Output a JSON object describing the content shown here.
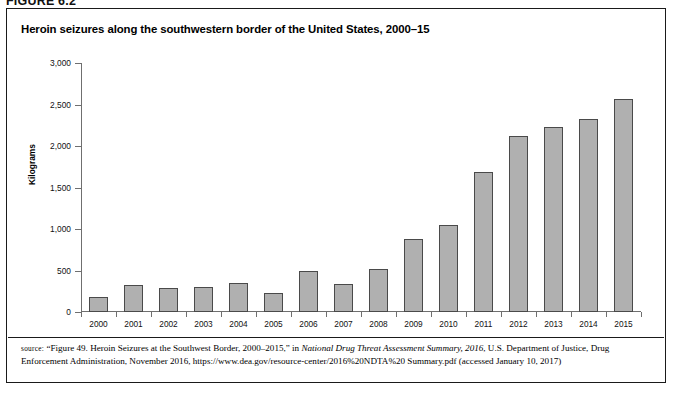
{
  "figure": {
    "label": "FIGURE 6.2",
    "title": "Heroin seizures along the southwestern border of the United States, 2000–15"
  },
  "axes": {
    "ylabel": "Kilograms",
    "yticks": [
      "0",
      "500",
      "1,000",
      "1,500",
      "2,000",
      "2,500",
      "3,000"
    ],
    "ymin": 0,
    "ymax": 3000,
    "ystep": 500
  },
  "source": {
    "prefix": "source:",
    "part1": " “Figure 49. Heroin Seizures at the Southwest Border, 2000–2015,” in ",
    "italic1": "National Drug Threat Assessment Summary, 2016",
    "part2": ", U.S. Department of Justice, Drug Enforcement Administration, November 2016, https://www.dea.gov/resource-center/2016%20NDTA%20 Summary.pdf (accessed January 10, 2017)"
  },
  "chart_data": {
    "type": "bar",
    "title": "Heroin seizures along the southwestern border of the United States, 2000–15",
    "xlabel": "",
    "ylabel": "Kilograms",
    "ylim": [
      0,
      3000
    ],
    "ytick_step": 500,
    "grid": false,
    "legend": "none",
    "categories": [
      "2000",
      "2001",
      "2002",
      "2003",
      "2004",
      "2005",
      "2006",
      "2007",
      "2008",
      "2009",
      "2010",
      "2011",
      "2012",
      "2013",
      "2014",
      "2015"
    ],
    "values": [
      175,
      320,
      290,
      300,
      355,
      235,
      490,
      340,
      520,
      880,
      1050,
      1690,
      2120,
      2230,
      2320,
      2570
    ],
    "bar_color": "#b0b0b0",
    "bar_edge_color": "#4a4a4a"
  }
}
